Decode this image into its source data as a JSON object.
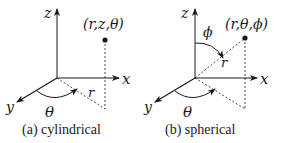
{
  "panels": [
    {
      "id": "cylindrical",
      "caption": "(a) cylindrical",
      "point_label": "(r,z,θ)",
      "axes": {
        "z": "z",
        "x": "x",
        "y": "y"
      },
      "radial_label": "r",
      "angle_labels": {
        "theta": "θ"
      }
    },
    {
      "id": "spherical",
      "caption": "(b) spherical",
      "point_label": "(r,θ,ϕ)",
      "axes": {
        "z": "z",
        "x": "x",
        "y": "y"
      },
      "radial_label": "r",
      "angle_labels": {
        "theta": "θ",
        "phi": "ϕ"
      }
    }
  ],
  "colors": {
    "line": "#1a1a1a",
    "background": "#ffffff"
  }
}
